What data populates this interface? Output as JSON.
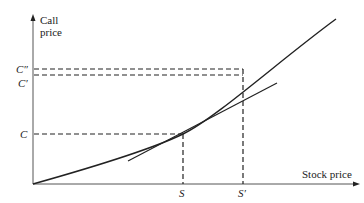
{
  "diagram": {
    "y_axis_label_line1": "Call",
    "y_axis_label_line2": "price",
    "x_axis_label": "Stock price",
    "y_ticks": {
      "c_double_prime": "C″",
      "c_prime": "C′",
      "c": "C"
    },
    "x_ticks": {
      "s": "S",
      "s_prime": "S′"
    },
    "elements": [
      "convex call price curve",
      "tangent line at S",
      "dashed guides from S and S' to C, C', C''"
    ],
    "colors": {
      "line": "#222222",
      "background": "#ffffff"
    }
  }
}
